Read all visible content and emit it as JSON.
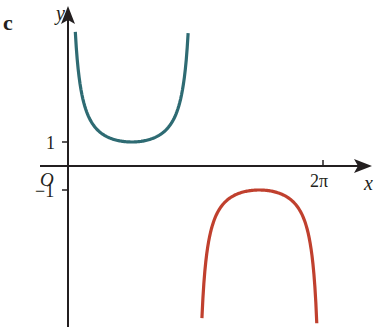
{
  "panel_label": "c",
  "chart_data": {
    "type": "line",
    "title": "",
    "xlabel": "x",
    "ylabel": "y",
    "origin_label": "O",
    "x_ticks": [
      {
        "value": 6.2832,
        "label": "2π"
      }
    ],
    "y_ticks": [
      {
        "value": 1,
        "label": "1"
      },
      {
        "value": -1,
        "label": "−1"
      }
    ],
    "xlim": [
      0,
      7.0
    ],
    "ylim": [
      -6.6,
      5.6
    ],
    "grid": false,
    "legend": null,
    "series": [
      {
        "name": "y = cosec x, 0 < x < π",
        "color": "#2e6b73",
        "domain": [
          0.18,
          2.96
        ],
        "min_point": {
          "x": 1.5708,
          "y": 1
        }
      },
      {
        "name": "y = cosec x, π < x < 2π",
        "color": "#c0402e",
        "domain": [
          3.3,
          6.13
        ],
        "max_point": {
          "x": 4.7124,
          "y": -1
        }
      }
    ]
  }
}
